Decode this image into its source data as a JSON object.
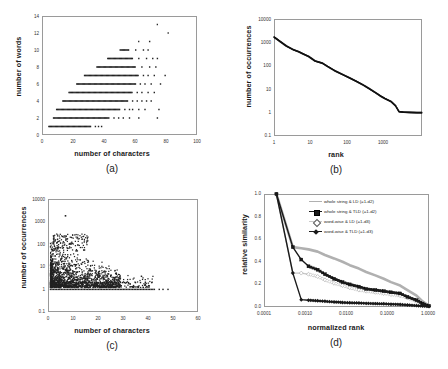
{
  "figure": {
    "panels": [
      {
        "caption": "(a)",
        "xlabel": "number of characters",
        "ylabel": "number of words"
      },
      {
        "caption": "(b)",
        "xlabel": "rank",
        "ylabel": "number of occurrences"
      },
      {
        "caption": "(c)",
        "xlabel": "number of characters",
        "ylabel": "number of occurrences"
      },
      {
        "caption": "(d)",
        "xlabel": "normalized rank",
        "ylabel": "relative similarity"
      }
    ]
  },
  "chart_data": [
    {
      "type": "scatter",
      "panel": "(a)",
      "title": "",
      "xlabel": "number of characters",
      "ylabel": "number of words",
      "xlim": [
        0,
        100
      ],
      "ylim": [
        0,
        14
      ],
      "xticks": [
        0,
        20,
        40,
        60,
        80,
        100
      ],
      "yticks": [
        0,
        2,
        4,
        6,
        8,
        10,
        12,
        14
      ],
      "xscale": "linear",
      "yscale": "linear",
      "grid": false,
      "legend": "none",
      "description": "Dense horizontal bands of points at each integer word count; band start and end character counts grow with number of words.",
      "bands": [
        {
          "words": 1,
          "char_min": 4,
          "char_max": 31,
          "outliers": [
            34,
            36,
            38
          ]
        },
        {
          "words": 2,
          "char_min": 7,
          "char_max": 43,
          "outliers": [
            46,
            49,
            52,
            56,
            62,
            74
          ]
        },
        {
          "words": 3,
          "char_min": 9,
          "char_max": 50,
          "outliers": [
            53,
            56,
            58,
            62,
            66,
            75
          ]
        },
        {
          "words": 4,
          "char_min": 13,
          "char_max": 55,
          "outliers": [
            58,
            61,
            64,
            67,
            70
          ]
        },
        {
          "words": 5,
          "char_min": 17,
          "char_max": 58,
          "outliers": [
            61,
            64,
            68,
            72
          ]
        },
        {
          "words": 6,
          "char_min": 22,
          "char_max": 60,
          "outliers": [
            63,
            66,
            70,
            76
          ]
        },
        {
          "words": 7,
          "char_min": 27,
          "char_max": 62,
          "outliers": [
            65,
            68,
            72,
            79
          ]
        },
        {
          "words": 8,
          "char_min": 35,
          "char_max": 60,
          "outliers": [
            64,
            69,
            73
          ]
        },
        {
          "words": 9,
          "char_min": 42,
          "char_max": 58,
          "outliers": [
            62,
            67,
            71,
            74
          ]
        },
        {
          "words": 10,
          "char_min": 50,
          "char_max": 56,
          "outliers": [
            60,
            65,
            68
          ]
        },
        {
          "words": 11,
          "char_min": 62,
          "char_max": 62,
          "outliers": [
            69
          ]
        },
        {
          "words": 12,
          "char_min": 81,
          "char_max": 81,
          "outliers": []
        },
        {
          "words": 13,
          "char_min": 74,
          "char_max": 74,
          "outliers": []
        }
      ]
    },
    {
      "type": "line",
      "panel": "(b)",
      "title": "",
      "xlabel": "rank",
      "ylabel": "number of occurrences",
      "xlim": [
        1,
        4000
      ],
      "ylim": [
        0.1,
        10000
      ],
      "xticks": [
        1,
        10,
        100,
        1000
      ],
      "yticks": [
        0.1,
        1,
        10,
        100,
        1000,
        10000
      ],
      "xscale": "log",
      "yscale": "log",
      "grid": false,
      "legend": "none",
      "description": "Zipf rank-frequency distribution; near power-law decay with a long flat tail at 1 occurrence.",
      "x": [
        1,
        2,
        3,
        4,
        5,
        7,
        10,
        15,
        20,
        30,
        50,
        70,
        100,
        150,
        200,
        300,
        400,
        500,
        700,
        900,
        1100,
        1400,
        2000,
        3000,
        4000
      ],
      "y": [
        1700,
        700,
        480,
        400,
        330,
        250,
        160,
        130,
        95,
        62,
        40,
        30,
        22,
        15,
        11,
        7,
        5,
        4,
        3,
        2,
        1.1,
        1.05,
        1.02,
        1.0,
        1.0
      ]
    },
    {
      "type": "scatter",
      "panel": "(c)",
      "title": "",
      "xlabel": "number of characters",
      "ylabel": "number of occurrences",
      "xlim": [
        0,
        60
      ],
      "ylim": [
        0.1,
        10000
      ],
      "xticks": [
        0,
        10,
        20,
        30,
        40,
        50,
        60
      ],
      "yticks": [
        0.1,
        1,
        10,
        100,
        1000,
        10000
      ],
      "xscale": "linear",
      "yscale": "log",
      "grid": false,
      "legend": "none",
      "description": "Cloud of points densest for 2-18 characters with occurrences 1-100; solid baseline row at 1 occurrence extends to about 43 characters with isolated outliers near 48; single high outlier near 1800 occurrences at 7 characters.",
      "baseline_occurrence": 1,
      "baseline_char_range": [
        1,
        43
      ],
      "peak_point": {
        "characters": 7,
        "occurrences": 1800
      }
    },
    {
      "type": "line",
      "panel": "(d)",
      "title": "",
      "xlabel": "normalized rank",
      "ylabel": "relative similarity",
      "xlim": [
        0.0001,
        1.0
      ],
      "ylim": [
        0.0,
        1.0
      ],
      "xticks": [
        0.0001,
        0.001,
        0.01,
        0.1,
        1.0
      ],
      "xtick_labels": [
        "0.0001",
        "0.0010",
        "0.0100",
        "0.1000",
        "1.0000"
      ],
      "yticks": [
        0.0,
        0.2,
        0.4,
        0.6,
        0.8,
        1.0
      ],
      "xscale": "log",
      "yscale": "linear",
      "grid": false,
      "legend": "top-right",
      "series": [
        {
          "name": "whole string & LD (=1-d2)",
          "color": "#b0b0b0",
          "marker": "line",
          "x": [
            0.0002,
            0.0005,
            0.0008,
            0.0012,
            0.002,
            0.003,
            0.005,
            0.008,
            0.012,
            0.02,
            0.03,
            0.05,
            0.08,
            0.12,
            0.2,
            0.3,
            0.5,
            0.7,
            1.0
          ],
          "y": [
            1.0,
            0.53,
            0.52,
            0.51,
            0.49,
            0.46,
            0.43,
            0.4,
            0.37,
            0.34,
            0.31,
            0.28,
            0.25,
            0.22,
            0.19,
            0.15,
            0.1,
            0.05,
            0.01
          ]
        },
        {
          "name": "whole string & TLD  (=1-d2)",
          "color": "#1a1a1a",
          "marker": "square",
          "x": [
            0.0002,
            0.0005,
            0.0008,
            0.0012,
            0.002,
            0.003,
            0.005,
            0.008,
            0.012,
            0.02,
            0.03,
            0.05,
            0.08,
            0.12,
            0.2,
            0.3,
            0.5,
            0.7,
            1.0
          ],
          "y": [
            1.0,
            0.53,
            0.42,
            0.36,
            0.33,
            0.29,
            0.25,
            0.22,
            0.2,
            0.18,
            0.16,
            0.15,
            0.14,
            0.13,
            0.12,
            0.09,
            0.06,
            0.03,
            0.01
          ]
        },
        {
          "name": "word-wise & LD (=1-d3)",
          "color": "#c8c8c8",
          "marker": "diamond-open",
          "x": [
            0.0002,
            0.0005,
            0.0008,
            0.0012,
            0.002,
            0.003,
            0.005,
            0.008,
            0.012,
            0.02,
            0.03,
            0.05,
            0.08,
            0.12,
            0.2,
            0.3,
            0.5,
            0.7,
            1.0
          ],
          "y": [
            1.0,
            0.3,
            0.3,
            0.29,
            0.27,
            0.24,
            0.21,
            0.19,
            0.17,
            0.15,
            0.14,
            0.13,
            0.12,
            0.11,
            0.1,
            0.08,
            0.05,
            0.03,
            0.01
          ]
        },
        {
          "name": "word-wise & TLD (=1-d3)",
          "color": "#1a1a1a",
          "marker": "diamond",
          "x": [
            0.0002,
            0.0005,
            0.0008,
            0.0012,
            0.002,
            0.003,
            0.005,
            0.008,
            0.012,
            0.02,
            0.03,
            0.05,
            0.08,
            0.12,
            0.2,
            0.3,
            0.5,
            0.7,
            1.0
          ],
          "y": [
            1.0,
            0.3,
            0.065,
            0.06,
            0.055,
            0.05,
            0.045,
            0.04,
            0.038,
            0.035,
            0.032,
            0.03,
            0.028,
            0.025,
            0.022,
            0.018,
            0.012,
            0.008,
            0.005
          ]
        }
      ]
    }
  ]
}
